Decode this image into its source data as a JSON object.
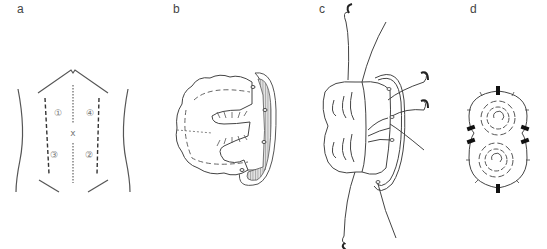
{
  "figure": {
    "panels": [
      {
        "id": "a",
        "label": "a",
        "description": "Abdomen with trocar port sites",
        "ports": [
          "①",
          "④",
          "③",
          "②"
        ],
        "umbilicus_mark": "x"
      },
      {
        "id": "b",
        "label": "b",
        "description": "Bowel pouch folded against mesh"
      },
      {
        "id": "c",
        "label": "c",
        "description": "Pouch anchored with sutures and needles"
      },
      {
        "id": "d",
        "label": "d",
        "description": "Completed double-lobed construct with anchors"
      }
    ]
  },
  "colors": {
    "line": "#555555",
    "hatch": "#999999",
    "fill_hatch": "#cfcfcf",
    "anchor": "#111111"
  }
}
